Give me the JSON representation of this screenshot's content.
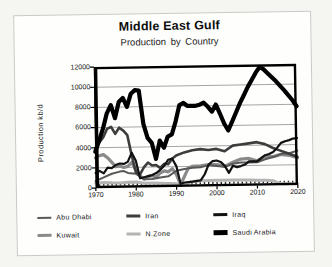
{
  "chart_data": {
    "type": "line",
    "title": "Middle East Gulf",
    "subtitle": "Production by Country",
    "ylabel": "Production kb/d",
    "xlabel": "",
    "xlim": [
      1970,
      2020
    ],
    "ylim": [
      0,
      12000
    ],
    "xticks": [
      1970,
      1980,
      1990,
      2000,
      2010,
      2020
    ],
    "yticks": [
      0,
      2000,
      4000,
      6000,
      8000,
      10000,
      12000
    ],
    "grid": "horizontal gray lines at each y tick",
    "frame": "black box around plot with yearly minor tick marks along bottom axis",
    "legend_position": "bottom, 3 columns x 2 rows",
    "background": "#ffffff",
    "draw_order": [
      4,
      3,
      0,
      1,
      2,
      5
    ],
    "series": [
      {
        "name": "Abu Dhabi",
        "color": "#585858",
        "stroke_width": 2,
        "points": [
          [
            1970,
            700
          ],
          [
            1972,
            1050
          ],
          [
            1974,
            1400
          ],
          [
            1976,
            1600
          ],
          [
            1977,
            1650
          ],
          [
            1978,
            1450
          ],
          [
            1980,
            1350
          ],
          [
            1982,
            800
          ],
          [
            1984,
            800
          ],
          [
            1986,
            950
          ],
          [
            1988,
            1050
          ],
          [
            1990,
            1600
          ],
          [
            1992,
            1750
          ],
          [
            1994,
            1850
          ],
          [
            1996,
            1900
          ],
          [
            1998,
            2100
          ],
          [
            2000,
            2000
          ],
          [
            2002,
            1900
          ],
          [
            2004,
            2200
          ],
          [
            2006,
            2300
          ],
          [
            2008,
            2300
          ],
          [
            2010,
            2300
          ],
          [
            2012,
            2600
          ],
          [
            2014,
            2800
          ],
          [
            2016,
            3100
          ],
          [
            2018,
            3150
          ],
          [
            2020,
            3400
          ]
        ]
      },
      {
        "name": "Iran",
        "color": "#3d3d3d",
        "stroke_width": 2.6,
        "points": [
          [
            1970,
            3800
          ],
          [
            1971,
            4500
          ],
          [
            1972,
            5000
          ],
          [
            1973,
            5850
          ],
          [
            1974,
            6050
          ],
          [
            1975,
            5350
          ],
          [
            1976,
            5950
          ],
          [
            1977,
            5650
          ],
          [
            1978,
            5200
          ],
          [
            1979,
            3150
          ],
          [
            1980,
            1500
          ],
          [
            1981,
            1300
          ],
          [
            1982,
            2000
          ],
          [
            1983,
            2450
          ],
          [
            1984,
            2150
          ],
          [
            1985,
            2200
          ],
          [
            1986,
            1900
          ],
          [
            1987,
            2300
          ],
          [
            1988,
            2250
          ],
          [
            1989,
            2800
          ],
          [
            1990,
            3100
          ],
          [
            1992,
            3400
          ],
          [
            1994,
            3600
          ],
          [
            1996,
            3700
          ],
          [
            1998,
            3600
          ],
          [
            2000,
            3700
          ],
          [
            2002,
            3450
          ],
          [
            2004,
            4000
          ],
          [
            2006,
            4100
          ],
          [
            2008,
            4200
          ],
          [
            2010,
            4300
          ],
          [
            2012,
            4100
          ],
          [
            2014,
            3700
          ],
          [
            2016,
            3400
          ],
          [
            2018,
            3100
          ],
          [
            2020,
            2800
          ]
        ]
      },
      {
        "name": "Iraq",
        "color": "#121212",
        "stroke_width": 2.2,
        "points": [
          [
            1970,
            1500
          ],
          [
            1971,
            1700
          ],
          [
            1972,
            1450
          ],
          [
            1973,
            2000
          ],
          [
            1974,
            1950
          ],
          [
            1975,
            2250
          ],
          [
            1976,
            2400
          ],
          [
            1977,
            2350
          ],
          [
            1978,
            2550
          ],
          [
            1979,
            3450
          ],
          [
            1980,
            2650
          ],
          [
            1981,
            900
          ],
          [
            1982,
            1000
          ],
          [
            1983,
            1100
          ],
          [
            1984,
            1200
          ],
          [
            1985,
            1400
          ],
          [
            1986,
            1700
          ],
          [
            1987,
            2100
          ],
          [
            1988,
            2700
          ],
          [
            1989,
            2800
          ],
          [
            1990,
            2050
          ],
          [
            1991,
            300
          ],
          [
            1992,
            420
          ],
          [
            1994,
            500
          ],
          [
            1996,
            600
          ],
          [
            1997,
            1200
          ],
          [
            1998,
            2150
          ],
          [
            1999,
            2500
          ],
          [
            2000,
            2550
          ],
          [
            2001,
            2400
          ],
          [
            2002,
            2000
          ],
          [
            2003,
            1300
          ],
          [
            2004,
            2000
          ],
          [
            2005,
            1850
          ],
          [
            2006,
            1950
          ],
          [
            2007,
            2100
          ],
          [
            2008,
            2400
          ],
          [
            2010,
            2400
          ],
          [
            2011,
            2700
          ],
          [
            2012,
            3000
          ],
          [
            2013,
            3100
          ],
          [
            2014,
            3300
          ],
          [
            2015,
            3700
          ],
          [
            2016,
            4200
          ],
          [
            2017,
            4350
          ],
          [
            2018,
            4450
          ],
          [
            2019,
            4600
          ],
          [
            2020,
            4650
          ]
        ]
      },
      {
        "name": "Kuwait",
        "color": "#8a8a8a",
        "stroke_width": 3.2,
        "points": [
          [
            1970,
            3000
          ],
          [
            1971,
            3200
          ],
          [
            1972,
            3300
          ],
          [
            1973,
            3000
          ],
          [
            1974,
            2550
          ],
          [
            1975,
            2100
          ],
          [
            1976,
            2150
          ],
          [
            1977,
            2000
          ],
          [
            1978,
            2100
          ],
          [
            1979,
            2500
          ],
          [
            1980,
            1650
          ],
          [
            1981,
            1150
          ],
          [
            1982,
            800
          ],
          [
            1983,
            1050
          ],
          [
            1984,
            1150
          ],
          [
            1985,
            1000
          ],
          [
            1986,
            1400
          ],
          [
            1987,
            1600
          ],
          [
            1988,
            1500
          ],
          [
            1989,
            1800
          ],
          [
            1990,
            1200
          ],
          [
            1991,
            200
          ],
          [
            1992,
            1050
          ],
          [
            1993,
            1850
          ],
          [
            1994,
            2000
          ],
          [
            1996,
            2050
          ],
          [
            1998,
            2150
          ],
          [
            2000,
            2150
          ],
          [
            2002,
            1950
          ],
          [
            2004,
            2350
          ],
          [
            2006,
            2650
          ],
          [
            2008,
            2700
          ],
          [
            2010,
            2450
          ],
          [
            2012,
            2900
          ],
          [
            2014,
            2850
          ],
          [
            2016,
            3050
          ],
          [
            2018,
            2950
          ],
          [
            2020,
            2700
          ]
        ]
      },
      {
        "name": "N.Zone",
        "color": "#b4b4b4",
        "stroke_width": 3,
        "points": [
          [
            1970,
            520
          ],
          [
            1972,
            540
          ],
          [
            1974,
            500
          ],
          [
            1976,
            480
          ],
          [
            1978,
            520
          ],
          [
            1980,
            540
          ],
          [
            1982,
            400
          ],
          [
            1984,
            420
          ],
          [
            1986,
            380
          ],
          [
            1988,
            350
          ],
          [
            1990,
            300
          ],
          [
            1991,
            130
          ],
          [
            1992,
            300
          ],
          [
            1994,
            500
          ],
          [
            1996,
            560
          ],
          [
            1998,
            580
          ],
          [
            2000,
            600
          ],
          [
            2002,
            570
          ],
          [
            2004,
            600
          ],
          [
            2006,
            580
          ],
          [
            2008,
            560
          ],
          [
            2010,
            540
          ],
          [
            2012,
            520
          ],
          [
            2014,
            450
          ],
          [
            2015,
            250
          ],
          [
            2016,
            150
          ],
          [
            2018,
            120
          ],
          [
            2020,
            110
          ]
        ]
      },
      {
        "name": "Saudi Arabia",
        "color": "#000000",
        "stroke_width": 4.2,
        "points": [
          [
            1970,
            3600
          ],
          [
            1971,
            4700
          ],
          [
            1972,
            5900
          ],
          [
            1973,
            7400
          ],
          [
            1974,
            8200
          ],
          [
            1975,
            6900
          ],
          [
            1976,
            8500
          ],
          [
            1977,
            8900
          ],
          [
            1978,
            8000
          ],
          [
            1979,
            9300
          ],
          [
            1980,
            9650
          ],
          [
            1981,
            9600
          ],
          [
            1982,
            6300
          ],
          [
            1983,
            4900
          ],
          [
            1984,
            4400
          ],
          [
            1985,
            2800
          ],
          [
            1986,
            4600
          ],
          [
            1987,
            3900
          ],
          [
            1988,
            5000
          ],
          [
            1989,
            5200
          ],
          [
            1990,
            6500
          ],
          [
            1991,
            8100
          ],
          [
            1992,
            8300
          ],
          [
            1993,
            8000
          ],
          [
            1995,
            8000
          ],
          [
            1996,
            8100
          ],
          [
            1997,
            8300
          ],
          [
            1998,
            7900
          ],
          [
            1999,
            7400
          ],
          [
            2000,
            8100
          ],
          [
            2001,
            7200
          ],
          [
            2002,
            6200
          ],
          [
            2003,
            5500
          ],
          [
            2004,
            6400
          ],
          [
            2005,
            7300
          ],
          [
            2006,
            8200
          ],
          [
            2007,
            9000
          ],
          [
            2008,
            9800
          ],
          [
            2009,
            10500
          ],
          [
            2010,
            11200
          ],
          [
            2011,
            11750
          ],
          [
            2012,
            11500
          ],
          [
            2013,
            11100
          ],
          [
            2015,
            10300
          ],
          [
            2017,
            9400
          ],
          [
            2019,
            8400
          ],
          [
            2020,
            7800
          ]
        ]
      }
    ]
  }
}
